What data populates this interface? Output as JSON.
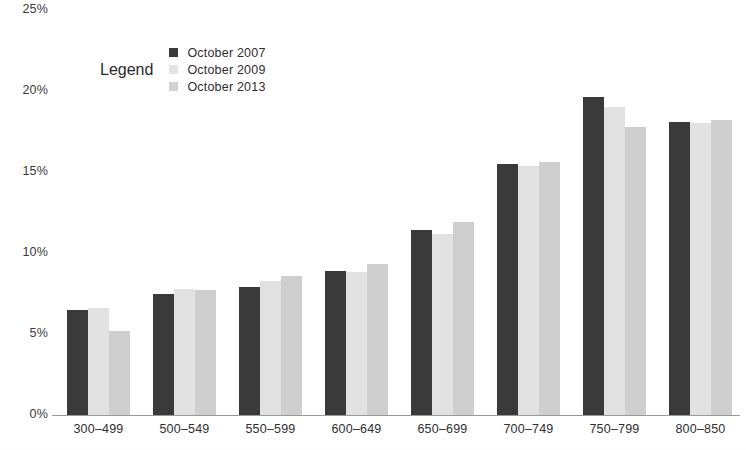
{
  "chart_data": {
    "type": "bar",
    "title": "",
    "subtitle": "",
    "xlabel": "",
    "ylabel": "",
    "categories": [
      "300–499",
      "500–549",
      "550–599",
      "600–649",
      "650–699",
      "700–749",
      "750–799",
      "800–850"
    ],
    "series": [
      {
        "name": "October 2007",
        "color": "#3a3a3a",
        "values": [
          6.5,
          7.5,
          7.9,
          8.9,
          11.4,
          15.5,
          19.6,
          18.1
        ]
      },
      {
        "name": "October 2009",
        "color": "#e2e2e2",
        "values": [
          6.6,
          7.8,
          8.3,
          8.8,
          11.2,
          15.4,
          19.0,
          18.0
        ]
      },
      {
        "name": "October 2013",
        "color": "#cfcfcf",
        "values": [
          5.2,
          7.7,
          8.6,
          9.3,
          11.9,
          15.6,
          17.8,
          18.2
        ]
      }
    ],
    "ylim": [
      0,
      25
    ],
    "ytick_values": [
      0,
      5,
      10,
      15,
      20,
      25
    ],
    "ytick_labels": [
      "0%",
      "5%",
      "10%",
      "15%",
      "20%",
      "25%"
    ],
    "grid": false,
    "legend_position": "top-center",
    "legend_title": "Legend"
  },
  "legend": {
    "title": "Legend",
    "entries": [
      {
        "label": "October 2007",
        "swatch": "legend-swatch-series-1"
      },
      {
        "label": "October 2009",
        "swatch": "legend-swatch-series-2"
      },
      {
        "label": "October 2013",
        "swatch": "legend-swatch-series-3"
      }
    ]
  },
  "axes": {
    "y_ticks": [
      "25%",
      "20%",
      "15%",
      "10%",
      "5%",
      "0%"
    ],
    "x_ticks": [
      "300–499",
      "500–549",
      "550–599",
      "600–649",
      "650–699",
      "700–749",
      "750–799",
      "800–850"
    ]
  }
}
